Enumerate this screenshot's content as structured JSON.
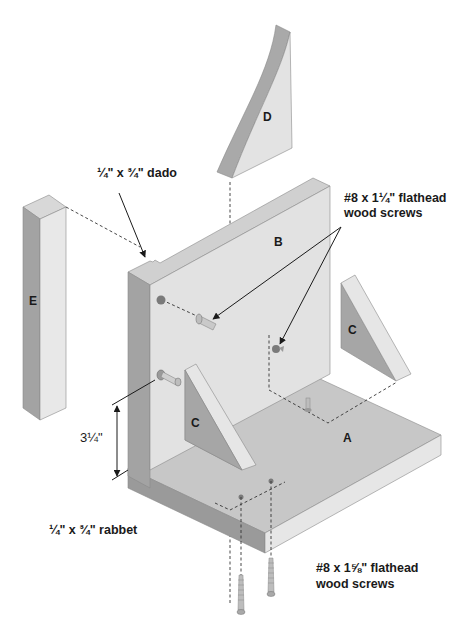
{
  "diagram": {
    "type": "exploded-assembly",
    "parts": {
      "A": "A",
      "B": "B",
      "C_front": "C",
      "C_right": "C",
      "D": "D",
      "E": "E"
    },
    "callouts": {
      "dado": "¼\" x ¾\" dado",
      "screws_top_line1": "#8 x 1¼\" flathead",
      "screws_top_line2": "wood screws",
      "screws_bottom_line1": "#8 x 1⅝\" flathead",
      "screws_bottom_line2": "wood screws",
      "rabbet": "¼\" x ¾\" rabbet",
      "dimension": "3¼\""
    },
    "colors": {
      "face_light": "#e6e6e6",
      "face_mid": "#cfcfcf",
      "face_dark": "#a9a9a9",
      "face_darker": "#8f8f8f",
      "ink": "#1a1a1a",
      "screw_head": "#7a7a7a"
    }
  }
}
